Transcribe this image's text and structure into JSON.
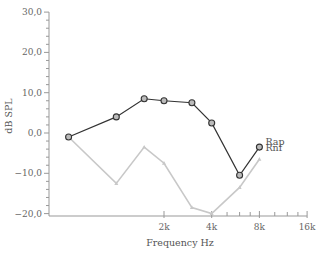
{
  "chart_data": {
    "type": "line",
    "title": "",
    "xlabel": "Frequency Hz",
    "ylabel": "dB SPL",
    "xscale": "log2",
    "xlim": [
      250,
      16000
    ],
    "ylim": [
      -20,
      30
    ],
    "yticks": [
      30,
      20,
      10,
      0,
      -10,
      -20
    ],
    "ytick_labels": [
      "30,0",
      "20,0",
      "10,0",
      "0,0",
      "−10,0",
      "−20,0"
    ],
    "xticks": [
      2000,
      4000,
      8000,
      16000
    ],
    "xtick_labels": [
      "2k",
      "4k",
      "8k",
      "16k"
    ],
    "grid": false,
    "legend_position": "inline-right",
    "x": [
      500,
      1000,
      1500,
      2000,
      3000,
      4000,
      6000,
      8000
    ],
    "series": [
      {
        "name": "Rap",
        "color": "#333333",
        "marker": "circle",
        "values": [
          -1,
          4,
          8.5,
          8,
          7.5,
          2.5,
          -10.5,
          -3.5
        ]
      },
      {
        "name": "Rnf",
        "color": "#c8c8c8",
        "marker": "triangle",
        "values": [
          -1,
          -12.5,
          -3.5,
          -7.5,
          -18.5,
          -20,
          -13.5,
          -6.5
        ]
      }
    ]
  }
}
